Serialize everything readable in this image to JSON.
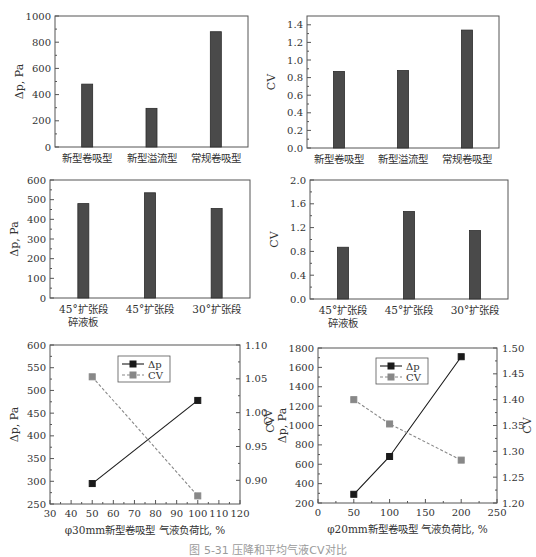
{
  "caption": "图 5-31  压降和平均气液CV对比",
  "chart_data": [
    {
      "id": "c1",
      "type": "bar",
      "box": [
        55,
        16,
        248,
        147
      ],
      "categories": [
        "新型卷吸型",
        "新型溢流型",
        "常规卷吸型"
      ],
      "values": [
        480,
        295,
        880
      ],
      "ylabel": "Δp, Pa",
      "ylim": [
        0,
        1000
      ],
      "yticks": [
        0,
        200,
        400,
        600,
        800,
        1000
      ],
      "ytick_labels": [
        "0",
        "200",
        "400",
        "600",
        "800",
        "1000"
      ],
      "grid": false
    },
    {
      "id": "c2",
      "type": "bar",
      "box": [
        307,
        16,
        499,
        148
      ],
      "categories": [
        "新型卷吸型",
        "新型溢流型",
        "常规卷吸型"
      ],
      "values": [
        0.87,
        0.88,
        1.34
      ],
      "ylabel": "CV",
      "ylim": [
        0,
        1.5
      ],
      "yticks": [
        0,
        0.2,
        0.4,
        0.6,
        0.8,
        1.0,
        1.2,
        1.4
      ],
      "ytick_labels": [
        "0.0",
        "0.2",
        "0.4",
        "0.6",
        "0.8",
        "1.0",
        "1.2",
        "1.4"
      ],
      "grid": false
    },
    {
      "id": "c3",
      "type": "bar",
      "box": [
        50,
        180,
        250,
        298
      ],
      "categories": [
        "45°扩张段\n碎液板",
        "45°扩张段",
        "30°扩张段"
      ],
      "values": [
        480,
        535,
        455
      ],
      "ylabel": "Δp, Pa",
      "ylim": [
        0,
        600
      ],
      "yticks": [
        0,
        100,
        200,
        300,
        400,
        500,
        600
      ],
      "ytick_labels": [
        "0",
        "100",
        "200",
        "300",
        "400",
        "500",
        "600"
      ],
      "grid": false
    },
    {
      "id": "c4",
      "type": "bar",
      "box": [
        310,
        180,
        508,
        299
      ],
      "categories": [
        "45°扩张段\n碎液板",
        "45°扩张段",
        "30°扩张段"
      ],
      "values": [
        0.87,
        1.47,
        1.15
      ],
      "ylabel": "CV",
      "ylim": [
        0,
        2.0
      ],
      "yticks": [
        0,
        0.4,
        0.8,
        1.2,
        1.6,
        2.0
      ],
      "ytick_labels": [
        "0.0",
        "0.4",
        "0.8",
        "1.2",
        "1.6",
        "2.0"
      ],
      "grid": false
    },
    {
      "id": "c5",
      "type": "line",
      "box": [
        50,
        345,
        240,
        504
      ],
      "xlabel": "φ30mm新型卷吸型 气液负荷比, %",
      "xlim": [
        30,
        120
      ],
      "xticks": [
        30,
        40,
        50,
        60,
        70,
        80,
        90,
        100,
        110,
        120
      ],
      "ylabel": "Δp, Pa",
      "ylim": [
        250,
        600
      ],
      "yticks": [
        250,
        300,
        350,
        400,
        450,
        500,
        550,
        600
      ],
      "y2label": "CV",
      "y2lim": [
        0.865,
        1.1
      ],
      "y2ticks": [
        0.9,
        0.95,
        1.0,
        1.05,
        1.1
      ],
      "y2tick_labels": [
        "0.90",
        "0.95",
        "1.00",
        "1.05",
        "1.10"
      ],
      "legend": {
        "position": "upper center",
        "x": 118,
        "y": 356
      },
      "series": [
        {
          "name": "Δp",
          "axis": "left",
          "style": "solid",
          "color": "#1a1a1a",
          "x": [
            50,
            100
          ],
          "y": [
            295,
            478
          ]
        },
        {
          "name": "CV",
          "axis": "right",
          "style": "dashed",
          "color": "#888888",
          "x": [
            50,
            100
          ],
          "y": [
            1.053,
            0.877
          ]
        }
      ]
    },
    {
      "id": "c6",
      "type": "line",
      "box": [
        318,
        348,
        497,
        503
      ],
      "xlabel": "φ20mm新型卷吸型 气液负荷比, %",
      "xlim": [
        0,
        250
      ],
      "xticks": [
        0,
        50,
        100,
        150,
        200,
        250
      ],
      "ylabel": "Δp, Pa",
      "ylim": [
        200,
        1800
      ],
      "yticks": [
        200,
        400,
        600,
        800,
        1000,
        1200,
        1400,
        1600,
        1800
      ],
      "y2label": "CV",
      "y2lim": [
        1.2,
        1.5
      ],
      "y2ticks": [
        1.2,
        1.25,
        1.3,
        1.35,
        1.4,
        1.45,
        1.5
      ],
      "y2tick_labels": [
        "1.20",
        "1.25",
        "1.30",
        "1.35",
        "1.40",
        "1.45",
        "1.50"
      ],
      "extra_left_label": "CV",
      "legend": {
        "position": "upper center",
        "x": 376,
        "y": 358
      },
      "series": [
        {
          "name": "Δp",
          "axis": "left",
          "style": "solid",
          "color": "#1a1a1a",
          "x": [
            50,
            100,
            200
          ],
          "y": [
            290,
            680,
            1710
          ]
        },
        {
          "name": "CV",
          "axis": "right",
          "style": "dashed",
          "color": "#888888",
          "x": [
            50,
            100,
            200
          ],
          "y": [
            1.4,
            1.353,
            1.283
          ]
        }
      ]
    }
  ]
}
